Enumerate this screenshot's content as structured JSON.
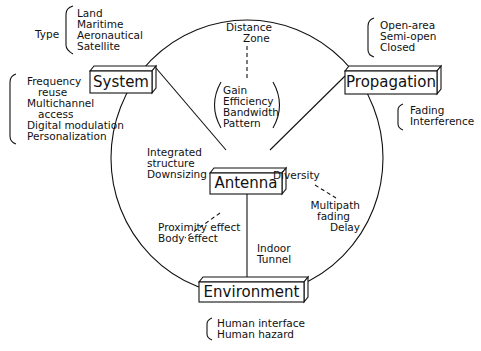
{
  "diagram": {
    "nodes": {
      "system": "System",
      "propagation": "Propagation",
      "antenna": "Antenna",
      "environment": "Environment"
    },
    "annotations": {
      "type_label": "Type",
      "type_items": [
        "Land",
        "Maritime",
        "Aeronautical",
        "Satellite"
      ],
      "system_items": [
        "Frequency",
        "reuse",
        "Multichannel",
        "access",
        "Digital modulation",
        "Personalization"
      ],
      "propagation_env_items": [
        "Open-area",
        "Semi-open",
        "Closed"
      ],
      "propagation_items": [
        "Fading",
        "Interference"
      ],
      "distance_items": [
        "Distance",
        "Zone"
      ],
      "antenna_params": [
        "Gain",
        "Efficiency",
        "Bandwidth",
        "Pattern"
      ],
      "structure_items": [
        "Integrated",
        "structure",
        "Downsizing"
      ],
      "diversity_label": "Diversity",
      "multipath_items": [
        "Multipath",
        "fading",
        "Delay"
      ],
      "proximity_items": [
        "Proximity effect",
        "Body effect"
      ],
      "indoor_items": [
        "Indoor",
        "Tunnel"
      ],
      "human_items": [
        "Human interface",
        "Human hazard"
      ]
    }
  }
}
